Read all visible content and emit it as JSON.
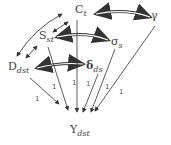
{
  "diagram": {
    "type": "path-diagram",
    "nodes": [
      {
        "id": "Ct",
        "base": "C",
        "sub": "t"
      },
      {
        "id": "gamma",
        "base": "γ",
        "sub": ""
      },
      {
        "id": "Sst",
        "base": "S",
        "sub": "st"
      },
      {
        "id": "sigma_s",
        "base": "σ",
        "sub": "s"
      },
      {
        "id": "Ddst",
        "base": "D",
        "sub": "dst"
      },
      {
        "id": "delta_ds",
        "base": "δ",
        "sub": "ds"
      },
      {
        "id": "Ydst",
        "base": "Y",
        "sub": "dst"
      }
    ],
    "edges": [
      {
        "from": "Ct",
        "to": "gamma",
        "type": "covariance"
      },
      {
        "from": "Sst",
        "to": "sigma_s",
        "type": "covariance"
      },
      {
        "from": "Ddst",
        "to": "delta_ds",
        "type": "covariance"
      },
      {
        "from": "Ct",
        "to": "Sst",
        "type": "covariance"
      },
      {
        "from": "Sst",
        "to": "Ddst",
        "type": "covariance"
      },
      {
        "from": "Ct",
        "to": "Ddst",
        "type": "covariance"
      },
      {
        "from": "Ddst",
        "to": "Ydst",
        "label": "1"
      },
      {
        "from": "Sst",
        "to": "Ydst",
        "label": "1"
      },
      {
        "from": "Ct",
        "to": "Ydst",
        "label": "1"
      },
      {
        "from": "delta_ds",
        "to": "Ydst",
        "label": "1"
      },
      {
        "from": "sigma_s",
        "to": "Ydst",
        "label": "1"
      },
      {
        "from": "gamma",
        "to": "Ydst",
        "label": "1"
      }
    ],
    "path_label": "1"
  }
}
